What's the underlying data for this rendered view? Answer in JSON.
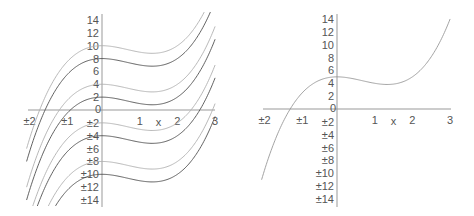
{
  "chart_data": [
    {
      "type": "line",
      "title": "",
      "description": "Family of antiderivatives f(x) = x^3 - 2x^2 + C",
      "xlabel": "x",
      "ylabel": "",
      "xlim": [
        -2,
        3
      ],
      "ylim": [
        -14,
        14
      ],
      "x_ticks": [
        "±2",
        "±1",
        "0",
        "1",
        "2",
        "3"
      ],
      "y_ticks_pos": [
        "14",
        "12",
        "10",
        "8",
        "6",
        "4",
        "2"
      ],
      "y_ticks_neg": [
        "±2",
        "±4",
        "±6",
        "±8",
        "±10",
        "±12",
        "±14"
      ],
      "grid": false,
      "series": [
        {
          "name": "C=10",
          "C": 10,
          "color": "#b0b0b0"
        },
        {
          "name": "C=8",
          "C": 8,
          "color": "#505050"
        },
        {
          "name": "C=4",
          "C": 4,
          "color": "#b0b0b0"
        },
        {
          "name": "C=2",
          "C": 2,
          "color": "#505050"
        },
        {
          "name": "C=-2",
          "C": -2,
          "color": "#b0b0b0"
        },
        {
          "name": "C=-4",
          "C": -4,
          "color": "#505050"
        },
        {
          "name": "C=-8",
          "C": -8,
          "color": "#b0b0b0"
        },
        {
          "name": "C=-10",
          "C": -10,
          "color": "#505050"
        }
      ]
    },
    {
      "type": "line",
      "title": "",
      "description": "Particular solution f(x) = x^3 - 2x^2 + 5",
      "xlabel": "x",
      "ylabel": "",
      "xlim": [
        -2,
        3
      ],
      "ylim": [
        -14,
        14
      ],
      "x_ticks": [
        "±2",
        "±1",
        "0",
        "1",
        "2",
        "3"
      ],
      "y_ticks_pos": [
        "14",
        "12",
        "10",
        "8",
        "6",
        "4",
        "2"
      ],
      "y_ticks_neg": [
        "±2",
        "±4",
        "±6",
        "±8",
        "±10",
        "±12",
        "±14"
      ],
      "grid": false,
      "series": [
        {
          "name": "C=5",
          "C": 5,
          "color": "#999999"
        }
      ]
    }
  ]
}
